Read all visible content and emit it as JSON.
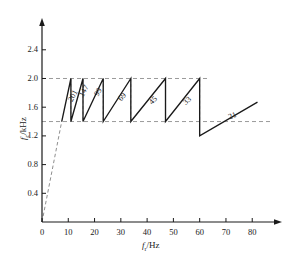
{
  "chart_data": {
    "type": "line",
    "title": "",
    "xlabel": "f_r/Hz",
    "ylabel": "f_c/kHz",
    "xlim": [
      0,
      86
    ],
    "ylim": [
      0,
      2.62
    ],
    "xticks": [
      0,
      10,
      20,
      30,
      40,
      50,
      60,
      70,
      80
    ],
    "yticks": [
      0.4,
      0.8,
      1.2,
      1.6,
      2.0,
      2.4
    ],
    "grid": false,
    "legend": null,
    "reference_lines": [
      {
        "name": "upper-limit",
        "axis": "y",
        "value": 2.0,
        "style": "dashed"
      },
      {
        "name": "lower-limit",
        "axis": "y",
        "value": 1.4,
        "style": "dashed"
      }
    ],
    "series": [
      {
        "name": "startup-ramp",
        "style": "dashed",
        "points": [
          [
            0,
            0.0
          ],
          [
            7.5,
            1.4
          ]
        ]
      },
      {
        "name": "sawtooth-carrier",
        "style": "solid",
        "points": [
          [
            7.5,
            1.4
          ],
          [
            11.0,
            2.0
          ],
          [
            11.0,
            1.4
          ],
          [
            15.6,
            2.0
          ],
          [
            15.6,
            1.4
          ],
          [
            23.3,
            2.0
          ],
          [
            23.3,
            1.4
          ],
          [
            33.8,
            2.0
          ],
          [
            33.8,
            1.4
          ],
          [
            47.0,
            2.0
          ],
          [
            47.0,
            1.4
          ],
          [
            60.0,
            2.0
          ],
          [
            60.0,
            1.2
          ],
          [
            82.0,
            1.67
          ]
        ]
      }
    ],
    "segment_labels": [
      {
        "text": "201",
        "x": 9.3,
        "y": 1.72,
        "angle": -62
      },
      {
        "text": "147",
        "x": 13.2,
        "y": 1.78,
        "angle": -62
      },
      {
        "text": "99",
        "x": 19.2,
        "y": 1.8,
        "angle": -58
      },
      {
        "text": "69",
        "x": 28.0,
        "y": 1.74,
        "angle": -50
      },
      {
        "text": "45",
        "x": 40.0,
        "y": 1.7,
        "angle": -45
      },
      {
        "text": "33",
        "x": 53.0,
        "y": 1.7,
        "angle": -42
      },
      {
        "text": "21",
        "x": 70.5,
        "y": 1.52,
        "angle": -22
      }
    ],
    "tick_labels": {
      "x": [
        "0",
        "10",
        "20",
        "30",
        "40",
        "50",
        "60",
        "70",
        "80"
      ],
      "y": [
        "0.4",
        "0.8",
        "1.2",
        "1.6",
        "2.0",
        "2.4"
      ]
    },
    "axis_labels": {
      "y_prefix": "f",
      "y_sub": "c",
      "y_suffix": "/kHz",
      "x_prefix": "f",
      "x_sub": "r",
      "x_suffix": "/Hz"
    },
    "colors": {
      "axis": "#1a1a1a",
      "curve": "#1a1a1a",
      "dashed": "#8a8a8a",
      "background": "#ffffff"
    }
  }
}
